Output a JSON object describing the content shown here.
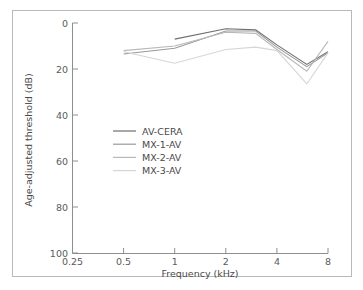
{
  "figure": {
    "border_color": "#b9b9b9",
    "background": "#ffffff"
  },
  "chart_data": {
    "type": "line",
    "title": "",
    "subtitle": "",
    "xlabel": "Frequency (kHz)",
    "ylabel": "Age-adjusted threshold (dB)",
    "x_scale": "log",
    "x_ticks": [
      0.25,
      0.5,
      1,
      2,
      4,
      8
    ],
    "x_tick_labels": [
      "0.25",
      "0.5",
      "1",
      "2",
      "4",
      "8"
    ],
    "xlim": [
      0.25,
      8
    ],
    "y_ticks": [
      0,
      20,
      40,
      60,
      80,
      100
    ],
    "y_tick_labels": [
      "0",
      "20",
      "40",
      "60",
      "80",
      "100"
    ],
    "ylim": [
      0,
      100
    ],
    "y_inverted": true,
    "grid": false,
    "legend_position": "center-left",
    "series": [
      {
        "name": "AV-CERA",
        "color": "#6f6f6f",
        "x": [
          1,
          2,
          3,
          4,
          6,
          8
        ],
        "values": [
          7,
          2.5,
          3,
          9.5,
          18,
          12.5
        ]
      },
      {
        "name": "MX-1-AV",
        "color": "#9a9a9a",
        "x": [
          0.5,
          1,
          2,
          3,
          4,
          6,
          8
        ],
        "values": [
          13.5,
          11,
          3.5,
          3.5,
          10.5,
          19,
          13
        ]
      },
      {
        "name": "MX-2-AV",
        "color": "#b8b8b8",
        "x": [
          0.5,
          1,
          2,
          3,
          4,
          6,
          8
        ],
        "values": [
          12,
          10,
          4,
          4.5,
          11.5,
          21,
          8
        ]
      },
      {
        "name": "MX-3-AV",
        "color": "#d6d6d6",
        "x": [
          0.5,
          1,
          2,
          3,
          4,
          6,
          8
        ],
        "values": [
          12.5,
          17.5,
          11.5,
          10.5,
          12,
          26.5,
          13
        ]
      }
    ]
  },
  "legend": {
    "items": [
      {
        "label": "AV-CERA",
        "color": "#6f6f6f"
      },
      {
        "label": "MX-1-AV",
        "color": "#9a9a9a"
      },
      {
        "label": "MX-2-AV",
        "color": "#b8b8b8"
      },
      {
        "label": "MX-3-AV",
        "color": "#d6d6d6"
      }
    ]
  }
}
